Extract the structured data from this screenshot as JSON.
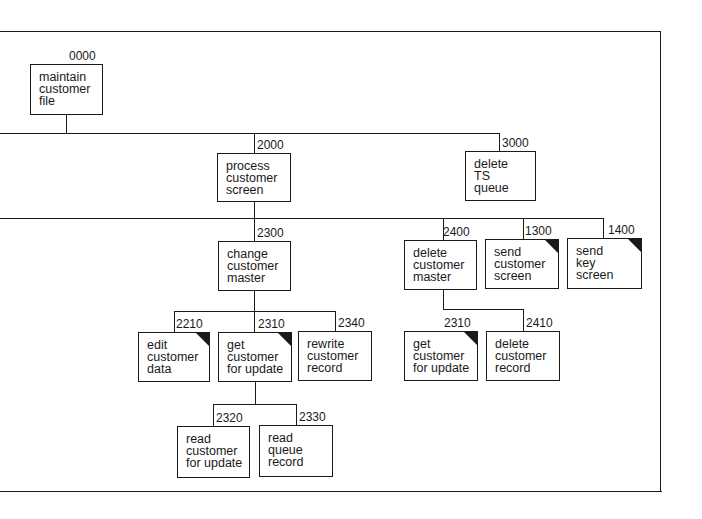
{
  "diagram": {
    "type": "structure-chart",
    "frame": {
      "left": 0,
      "top": 31,
      "right": 661,
      "bottom": 491
    },
    "modules": [
      {
        "id": "0000",
        "lines": [
          "maintain",
          "customer",
          "file"
        ],
        "common": false,
        "x": 30,
        "y": 64,
        "w": 73,
        "h": 51
      },
      {
        "id": "2000",
        "lines": [
          "process",
          "customer",
          "screen"
        ],
        "common": false,
        "x": 217,
        "y": 153,
        "w": 74,
        "h": 49
      },
      {
        "id": "3000",
        "lines": [
          "delete",
          "TS",
          "queue"
        ],
        "common": false,
        "x": 465,
        "y": 151,
        "w": 71,
        "h": 50
      },
      {
        "id": "2300",
        "lines": [
          "change",
          "customer",
          "master"
        ],
        "common": false,
        "x": 218,
        "y": 241,
        "w": 73,
        "h": 50
      },
      {
        "id": "2400",
        "lines": [
          "delete",
          "customer",
          "master"
        ],
        "common": false,
        "x": 404,
        "y": 240,
        "w": 73,
        "h": 50
      },
      {
        "id": "1300",
        "lines": [
          "send",
          "customer",
          "screen"
        ],
        "common": true,
        "x": 485,
        "y": 239,
        "w": 74,
        "h": 50
      },
      {
        "id": "1400",
        "lines": [
          "send",
          "key",
          "screen"
        ],
        "common": true,
        "x": 567,
        "y": 238,
        "w": 75,
        "h": 51
      },
      {
        "id": "2210",
        "lines": [
          "edit",
          "customer",
          "data"
        ],
        "common": true,
        "x": 138,
        "y": 332,
        "w": 72,
        "h": 50
      },
      {
        "id": "2310",
        "lines": [
          "get",
          "customer",
          "for update"
        ],
        "common": true,
        "x": 218,
        "y": 332,
        "w": 74,
        "h": 50
      },
      {
        "id": "2340",
        "lines": [
          "rewrite",
          "customer",
          "record"
        ],
        "common": false,
        "x": 298,
        "y": 331,
        "w": 74,
        "h": 50
      },
      {
        "id": "2310",
        "lines": [
          "get",
          "customer",
          "for update"
        ],
        "common": true,
        "x": 404,
        "y": 331,
        "w": 74,
        "h": 50
      },
      {
        "id": "2410",
        "lines": [
          "delete",
          "customer",
          "record"
        ],
        "common": false,
        "x": 486,
        "y": 331,
        "w": 74,
        "h": 50
      },
      {
        "id": "2320",
        "lines": [
          "read",
          "customer",
          "for update"
        ],
        "common": false,
        "x": 177,
        "y": 426,
        "w": 73,
        "h": 52
      },
      {
        "id": "2330",
        "lines": [
          "read",
          "queue",
          "record"
        ],
        "common": false,
        "x": 259,
        "y": 425,
        "w": 74,
        "h": 52
      }
    ],
    "connections": [
      {
        "from": "0000",
        "to": [
          "2000",
          "3000"
        ]
      },
      {
        "from": "2000",
        "to": [
          "2300",
          "2400",
          "1300",
          "1400"
        ]
      },
      {
        "from": "2300",
        "to": [
          "2210",
          "2310",
          "2340"
        ]
      },
      {
        "from": "2400",
        "to": [
          "2310",
          "2410"
        ]
      },
      {
        "from": "2310",
        "to": [
          "2320",
          "2330"
        ]
      }
    ]
  }
}
